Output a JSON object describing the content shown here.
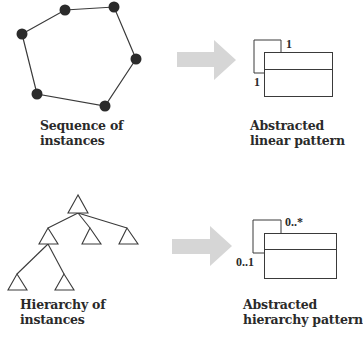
{
  "panels": {
    "sequence": {
      "caption_line1": "Sequence of",
      "caption_line2": "instances",
      "nodes": [
        [
          22,
          34
        ],
        [
          65,
          10
        ],
        [
          114,
          7
        ],
        [
          136,
          59
        ],
        [
          105,
          106
        ],
        [
          37,
          94
        ]
      ]
    },
    "linear_pattern": {
      "caption_line1": "Abstracted",
      "caption_line2": "linear pattern",
      "multiplicity_top": "1",
      "multiplicity_bottom": "1"
    },
    "hierarchy": {
      "caption_line1": "Hierarchy of",
      "caption_line2": "instances"
    },
    "hierarchy_pattern": {
      "caption_line1": "Abstracted",
      "caption_line2": "hierarchy pattern",
      "multiplicity_top": "0..*",
      "multiplicity_bottom": "0..1"
    }
  },
  "colors": {
    "stroke": "#3a3a3a",
    "node_fill": "#2b2b2b",
    "arrow_fill": "#d6d6d6"
  }
}
